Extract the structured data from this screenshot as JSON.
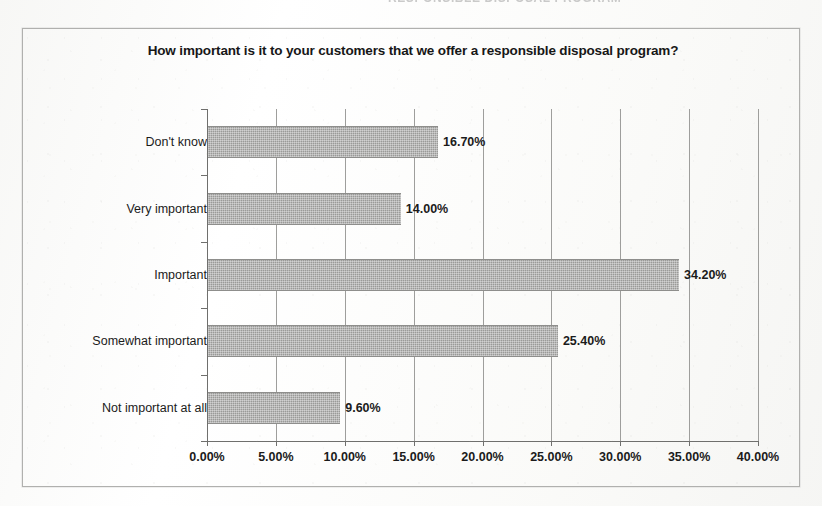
{
  "page": {
    "running_header": "RESPONSIBLE DISPOSAL PROGRAM"
  },
  "chart_data": {
    "type": "bar",
    "orientation": "horizontal",
    "title": "How important is it to your customers that we offer a responsible disposal program?",
    "xlabel": "",
    "ylabel": "",
    "categories": [
      "Don't know",
      "Very important",
      "Important",
      "Somewhat important",
      "Not important at all"
    ],
    "values": [
      16.7,
      14.0,
      34.2,
      25.4,
      9.6
    ],
    "data_labels": [
      "16.70%",
      "14.00%",
      "34.20%",
      "25.40%",
      "9.60%"
    ],
    "xlim": [
      0,
      40
    ],
    "xtick_values": [
      0,
      5,
      10,
      15,
      20,
      25,
      30,
      35,
      40
    ],
    "xtick_labels": [
      "0.00%",
      "5.00%",
      "10.00%",
      "15.00%",
      "20.00%",
      "25.00%",
      "30.00%",
      "35.00%",
      "40.00%"
    ],
    "grid": true,
    "legend": false,
    "bar_color": "#9a9a98",
    "axis_color": "#6f6f6d",
    "gridline_color": "#9e9e9c",
    "text_color": "#1b1b1b",
    "frame_color": "#b0b0ae"
  }
}
